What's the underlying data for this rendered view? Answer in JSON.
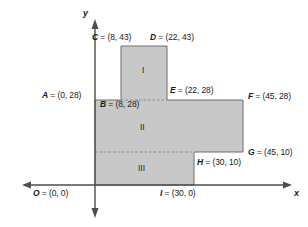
{
  "figure": {
    "type": "coordinate-geometry-diagram",
    "colors": {
      "fill": "#c8c8c8",
      "stroke": "#6e6e6e",
      "axis": "#4d4d4d",
      "text": "#1a1a1a",
      "dashed": "#8a8a8a",
      "background": "#ffffff"
    },
    "axes": {
      "x_label": "x",
      "y_label": "y"
    },
    "points": [
      {
        "id": "A",
        "label": "A = (0, 28)",
        "x": 0,
        "y": 28
      },
      {
        "id": "B",
        "label": "B = (8, 28)",
        "x": 8,
        "y": 28
      },
      {
        "id": "C",
        "label": "C = (8, 43)",
        "x": 8,
        "y": 43
      },
      {
        "id": "D",
        "label": "D = (22, 43)",
        "x": 22,
        "y": 43
      },
      {
        "id": "E",
        "label": "E = (22, 28)",
        "x": 22,
        "y": 28
      },
      {
        "id": "F",
        "label": "F = (45, 28)",
        "x": 45,
        "y": 28
      },
      {
        "id": "G",
        "label": "G = (45, 10)",
        "x": 45,
        "y": 10
      },
      {
        "id": "H",
        "label": "H = (30, 10)",
        "x": 30,
        "y": 10
      },
      {
        "id": "I",
        "label": "I = (30, 0)",
        "x": 30,
        "y": 0
      },
      {
        "id": "O",
        "label": "O = (0, 0)",
        "x": 0,
        "y": 0
      }
    ],
    "regions": [
      {
        "id": "I",
        "label": "I"
      },
      {
        "id": "II",
        "label": "II"
      },
      {
        "id": "III",
        "label": "III"
      }
    ]
  }
}
